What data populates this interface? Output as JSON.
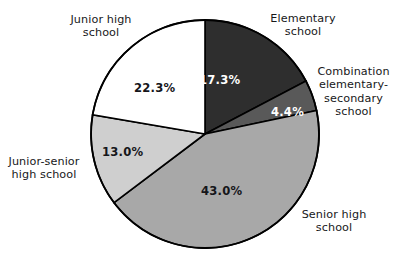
{
  "chart_data": {
    "type": "pie",
    "title": "",
    "subtitle": "",
    "xlabel": "",
    "ylabel": "",
    "legend_position": "none",
    "grid": false,
    "units": "percent",
    "start_angle_deg": 0,
    "direction": "clockwise",
    "categories": [
      "Elementary school",
      "Combination elementary-secondary school",
      "Senior high school",
      "Junior-senior high school",
      "Junior high school"
    ],
    "values": [
      17.3,
      4.4,
      43.0,
      13.0,
      22.3
    ],
    "value_labels": [
      "17.3%",
      "4.4%",
      "43.0%",
      "13.0%",
      "22.3%"
    ],
    "colors": [
      "#2e2e2e",
      "#595959",
      "#a8a8a8",
      "#cfcfcf",
      "#ffffff"
    ],
    "slices": [
      {
        "name": "Elementary school",
        "value": 17.3,
        "value_label": "17.3%",
        "label_lines": "Elementary\nschool",
        "color": "#2e2e2e",
        "label_text_color": "#ffffff"
      },
      {
        "name": "Combination elementary-secondary school",
        "value": 4.4,
        "value_label": "4.4%",
        "label_lines": "Combination\nelementary-\nsecondary\nschool",
        "color": "#595959",
        "label_text_color": "#ffffff"
      },
      {
        "name": "Senior high school",
        "value": 43.0,
        "value_label": "43.0%",
        "label_lines": "Senior high\nschool",
        "color": "#a8a8a8",
        "label_text_color": "#15161a"
      },
      {
        "name": "Junior-senior high school",
        "value": 13.0,
        "value_label": "13.0%",
        "label_lines": "Junior-senior\nhigh school",
        "color": "#cfcfcf",
        "label_text_color": "#15161a"
      },
      {
        "name": "Junior high school",
        "value": 22.3,
        "value_label": "22.3%",
        "label_lines": "Junior high\nschool",
        "color": "#ffffff",
        "label_text_color": "#15161a"
      }
    ],
    "total": 100.0
  },
  "style": {
    "outline_color": "#000000",
    "background": "#ffffff"
  }
}
